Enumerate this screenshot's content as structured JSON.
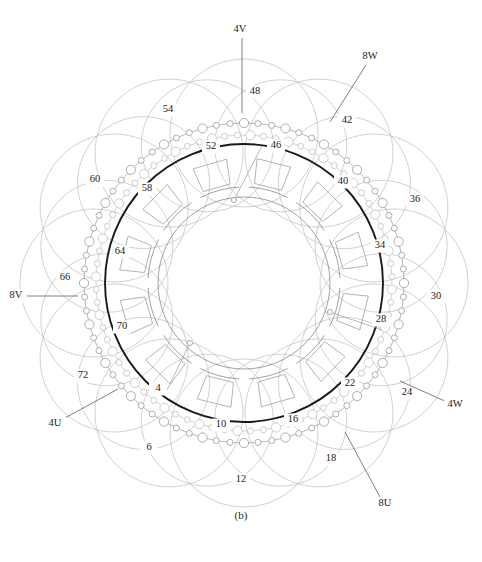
{
  "figure": {
    "caption": "(b)",
    "title_internal": "Stator with distributed hairpin winding - end view",
    "background": "#ffffff"
  },
  "colors": {
    "core_outline": "#1a1a1a",
    "inner_ring": "#8a8a8a",
    "slot_outline": "#9a9a9a",
    "coil_dark": "#8c8c8c",
    "coil_light": "#c2c2c2",
    "coil_node": "#9a9a9a",
    "leader": "#555555",
    "text": "#1a1a1a"
  },
  "geometry": {
    "center_x": 244,
    "center_y": 283,
    "core_outer_radius": 139,
    "core_inner_radius": 96,
    "bore_radius": 86,
    "coil_ring_outer_radius": 160,
    "coil_ring_inner_radius": 148,
    "coil_loop_radius": 74,
    "coil_loop_count": 12,
    "slot_count": 12,
    "node_large_r": 4.6,
    "node_small_r": 3.0
  },
  "reference_numbers": [
    {
      "id": "4",
      "label": "4",
      "x": 158,
      "y": 389,
      "leader": false
    },
    {
      "id": "6",
      "label": "6",
      "x": 149,
      "y": 448,
      "leader": false
    },
    {
      "id": "10",
      "label": "10",
      "x": 221,
      "y": 425,
      "leader": false
    },
    {
      "id": "12",
      "label": "12",
      "x": 241,
      "y": 480,
      "leader": false
    },
    {
      "id": "16",
      "label": "16",
      "x": 293,
      "y": 420,
      "leader": false
    },
    {
      "id": "18",
      "label": "18",
      "x": 331,
      "y": 459,
      "leader": false
    },
    {
      "id": "22",
      "label": "22",
      "x": 350,
      "y": 384,
      "leader": false
    },
    {
      "id": "24",
      "label": "24",
      "x": 407,
      "y": 393,
      "leader": false
    },
    {
      "id": "28",
      "label": "28",
      "x": 381,
      "y": 320,
      "leader": false
    },
    {
      "id": "30",
      "label": "30",
      "x": 436,
      "y": 297,
      "leader": false
    },
    {
      "id": "34",
      "label": "34",
      "x": 380,
      "y": 246,
      "leader": false
    },
    {
      "id": "36",
      "label": "36",
      "x": 415,
      "y": 200,
      "leader": false
    },
    {
      "id": "40",
      "label": "40",
      "x": 343,
      "y": 182,
      "leader": false
    },
    {
      "id": "42",
      "label": "42",
      "x": 347,
      "y": 121,
      "leader": false
    },
    {
      "id": "46",
      "label": "46",
      "x": 276,
      "y": 146,
      "leader": false
    },
    {
      "id": "48",
      "label": "48",
      "x": 255,
      "y": 92,
      "leader": false
    },
    {
      "id": "52",
      "label": "52",
      "x": 211,
      "y": 147,
      "leader": false
    },
    {
      "id": "54",
      "label": "54",
      "x": 168,
      "y": 110,
      "leader": false
    },
    {
      "id": "58",
      "label": "58",
      "x": 147,
      "y": 189,
      "leader": false
    },
    {
      "id": "60",
      "label": "60",
      "x": 95,
      "y": 180,
      "leader": false
    },
    {
      "id": "64",
      "label": "64",
      "x": 120,
      "y": 252,
      "leader": false
    },
    {
      "id": "66",
      "label": "66",
      "x": 65,
      "y": 278,
      "leader": false
    },
    {
      "id": "70",
      "label": "70",
      "x": 122,
      "y": 327,
      "leader": false
    },
    {
      "id": "72",
      "label": "72",
      "x": 83,
      "y": 376,
      "leader": false
    }
  ],
  "phase_terminals": [
    {
      "id": "4V",
      "label": "4V",
      "x": 240,
      "y": 30,
      "line": [
        [
          242,
          38
        ],
        [
          242,
          113
        ]
      ]
    },
    {
      "id": "8W",
      "label": "8W",
      "x": 370,
      "y": 57,
      "line": [
        [
          366,
          65
        ],
        [
          330,
          122
        ]
      ]
    },
    {
      "id": "4W",
      "label": "4W",
      "x": 455,
      "y": 405,
      "line": [
        [
          447,
          402
        ],
        [
          400,
          381
        ]
      ]
    },
    {
      "id": "8U",
      "label": "8U",
      "x": 385,
      "y": 504,
      "line": [
        [
          380,
          497
        ],
        [
          345,
          432
        ]
      ]
    },
    {
      "id": "4U",
      "label": "4U",
      "x": 55,
      "y": 424,
      "line": [
        [
          63,
          419
        ],
        [
          118,
          389
        ]
      ]
    },
    {
      "id": "8V",
      "label": "8V",
      "x": 16,
      "y": 296,
      "line": [
        [
          26,
          296
        ],
        [
          78,
          296
        ]
      ]
    }
  ],
  "inner_leader_dots": [
    {
      "id": "dot-top",
      "x": 234,
      "y": 200,
      "to_x": 262,
      "to_y": 146
    },
    {
      "id": "dot-right",
      "x": 330,
      "y": 312,
      "to_x": 382,
      "to_y": 330
    },
    {
      "id": "dot-bottom",
      "x": 190,
      "y": 343,
      "to_x": 164,
      "to_y": 396
    }
  ],
  "slot_labels_note": "Twelve trapezoidal stator slots between core inner and outer radii",
  "winding": {
    "description": "Two interleaved concentric conductor chains with alternating large and small circular nodes",
    "chain_outer_nodes": 72,
    "chain_inner_nodes": 72,
    "overlapping_end_loops": 12
  }
}
